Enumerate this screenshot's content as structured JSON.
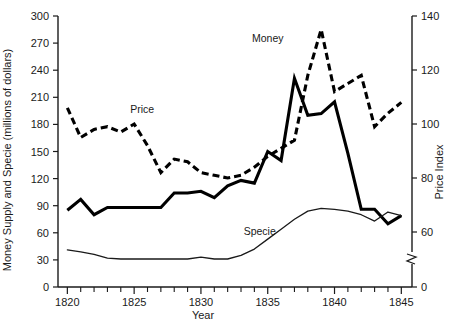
{
  "chart_data": {
    "type": "line",
    "title": "",
    "xlabel": "Year",
    "ylabel": "Money Supply and Specie (millions of dollars)",
    "y2label": "Price Index",
    "xlim": [
      1819.3,
      1845.8
    ],
    "ylim": [
      0,
      300
    ],
    "y2lim": [
      0,
      140
    ],
    "grid": false,
    "legend": "inline-annotations",
    "x_ticks_major": [
      1820,
      1825,
      1830,
      1835,
      1840,
      1845
    ],
    "x_ticks_minor": [
      1821,
      1822,
      1823,
      1824,
      1826,
      1827,
      1828,
      1829,
      1831,
      1832,
      1833,
      1834,
      1836,
      1837,
      1838,
      1839,
      1841,
      1842,
      1843,
      1844
    ],
    "y_ticks": [
      0,
      30,
      60,
      90,
      120,
      150,
      180,
      210,
      240,
      270,
      300
    ],
    "y2_ticks": [
      0,
      60,
      80,
      100,
      120,
      140
    ],
    "y2_axis_break_between": [
      0,
      60
    ],
    "x": [
      1820,
      1821,
      1822,
      1823,
      1824,
      1825,
      1826,
      1827,
      1828,
      1829,
      1830,
      1831,
      1832,
      1833,
      1834,
      1835,
      1836,
      1837,
      1838,
      1839,
      1840,
      1841,
      1842,
      1843,
      1844,
      1845
    ],
    "series": [
      {
        "name": "Money",
        "axis": "left",
        "style": "solid-thick",
        "label_x": 1835.0,
        "label_y": 271,
        "values": [
          85,
          97,
          80,
          88,
          88,
          88,
          88,
          88,
          104,
          104,
          106,
          99,
          112,
          118,
          115,
          150,
          140,
          231,
          190,
          192,
          205,
          148,
          86,
          86,
          70,
          79
        ]
      },
      {
        "name": "Price",
        "axis": "right",
        "style": "dashed-thick",
        "label_x": 1825.6,
        "label_y": 104,
        "values": [
          106,
          95,
          98,
          99,
          97,
          100,
          92,
          82,
          87,
          86,
          82,
          81,
          80,
          81,
          84,
          88,
          91,
          94,
          118,
          135,
          112,
          115,
          118,
          99,
          104,
          108
        ]
      },
      {
        "name": "Specie",
        "axis": "left",
        "style": "solid-thin",
        "label_x": 1834.4,
        "label_y": 58,
        "values": [
          41,
          39,
          36,
          32,
          31,
          31,
          31,
          31,
          31,
          31,
          33,
          31,
          31,
          35,
          42,
          53,
          64,
          75,
          84,
          87,
          86,
          84,
          80,
          73,
          83,
          79
        ]
      }
    ]
  },
  "annotations": {
    "money_label": "Money",
    "price_label": "Price",
    "specie_label": "Specie"
  },
  "axes": {
    "x_title": "Year",
    "y_left_title": "Money Supply and Specie (millions of dollars)",
    "y_right_title": "Price Index",
    "x_tick_labels": [
      "1820",
      "1825",
      "1830",
      "1835",
      "1840",
      "1845"
    ],
    "y_left_tick_labels": [
      "0",
      "30",
      "60",
      "90",
      "120",
      "150",
      "180",
      "210",
      "240",
      "270",
      "300"
    ],
    "y_right_tick_labels": [
      "0",
      "60",
      "80",
      "100",
      "120",
      "140"
    ]
  },
  "colors": {
    "ink": "#1a1a1a",
    "line": "#000000",
    "background": "#ffffff"
  }
}
